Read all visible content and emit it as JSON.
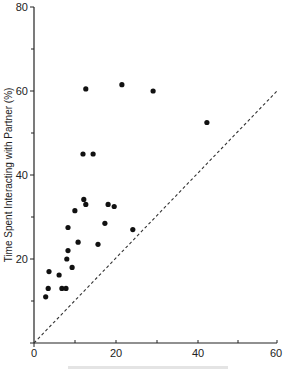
{
  "chart_data": {
    "type": "scatter",
    "title": "",
    "xlabel": "",
    "ylabel": "Time Spent Interacting with Partner (%)",
    "xlim": [
      0,
      60
    ],
    "ylim": [
      0,
      80
    ],
    "x_ticks": [
      0,
      20,
      40,
      60
    ],
    "x_minor_ticks": [
      10,
      30,
      50
    ],
    "y_ticks": [
      20,
      40,
      60,
      80
    ],
    "y_minor_ticks": [
      10,
      30,
      50,
      70
    ],
    "grid": false,
    "legend": null,
    "reference_line": {
      "style": "dashed",
      "from": [
        0,
        0
      ],
      "to": [
        60,
        60
      ],
      "label": "y = x"
    },
    "series": [
      {
        "name": "points",
        "marker": "filled-circle",
        "color": "#111111",
        "points": [
          {
            "x": 2.9,
            "y": 11.0
          },
          {
            "x": 3.5,
            "y": 13.0
          },
          {
            "x": 3.7,
            "y": 17.0
          },
          {
            "x": 6.2,
            "y": 16.2
          },
          {
            "x": 6.9,
            "y": 13.0
          },
          {
            "x": 7.9,
            "y": 13.0
          },
          {
            "x": 8.1,
            "y": 20.0
          },
          {
            "x": 8.4,
            "y": 22.0
          },
          {
            "x": 9.4,
            "y": 18.0
          },
          {
            "x": 8.4,
            "y": 27.5
          },
          {
            "x": 10.1,
            "y": 31.5
          },
          {
            "x": 10.9,
            "y": 24.0
          },
          {
            "x": 12.3,
            "y": 34.2
          },
          {
            "x": 12.8,
            "y": 33.0
          },
          {
            "x": 15.8,
            "y": 23.5
          },
          {
            "x": 17.5,
            "y": 28.5
          },
          {
            "x": 18.3,
            "y": 33.0
          },
          {
            "x": 19.8,
            "y": 32.5
          },
          {
            "x": 24.4,
            "y": 27.0
          },
          {
            "x": 12.1,
            "y": 45.0
          },
          {
            "x": 14.6,
            "y": 45.0
          },
          {
            "x": 12.8,
            "y": 60.5
          },
          {
            "x": 21.7,
            "y": 61.5
          },
          {
            "x": 29.4,
            "y": 60.0
          },
          {
            "x": 42.7,
            "y": 52.5
          }
        ]
      }
    ]
  },
  "labels": {
    "y_axis_title": "Time Spent Interacting with Partner (%)",
    "x_tick_0": "0",
    "x_tick_20": "20",
    "x_tick_40": "40",
    "x_tick_60": "60",
    "y_tick_20": "20",
    "y_tick_40": "40",
    "y_tick_60": "60",
    "y_tick_80": "80"
  }
}
